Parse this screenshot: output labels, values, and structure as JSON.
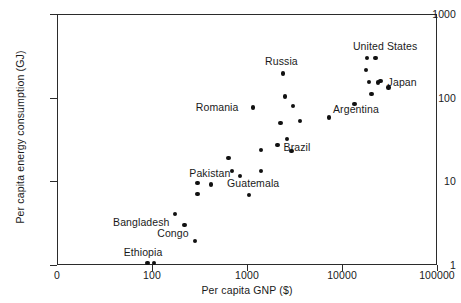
{
  "chart_data": {
    "type": "scatter",
    "title": "",
    "xlabel": "Per capita GNP ($)",
    "ylabel": "Per capita energy consumption (GJ)",
    "xscale": "log",
    "yscale": "log",
    "xlim": [
      100,
      100000
    ],
    "ylim": [
      1,
      1000
    ],
    "grid": false,
    "legend": "none",
    "origin_label": "0",
    "xticks": [
      {
        "label": "100",
        "value": 100
      },
      {
        "label": "1000",
        "value": 1000
      },
      {
        "label": "10000",
        "value": 10000
      },
      {
        "label": "100000",
        "value": 100000
      }
    ],
    "yticks": [
      {
        "label": "1",
        "value": 1
      },
      {
        "label": "10",
        "value": 10
      },
      {
        "label": "100",
        "value": 100
      },
      {
        "label": "1000",
        "value": 1000
      }
    ],
    "points": [
      {
        "x": 90,
        "y": 1.05,
        "label": "Ethiopia",
        "lx": -24,
        "ly": -16
      },
      {
        "x": 105,
        "y": 1.05,
        "label": "",
        "lx": 0,
        "ly": 0
      },
      {
        "x": 175,
        "y": 4.1,
        "label": "Bangladesh",
        "lx": -62,
        "ly": 3
      },
      {
        "x": 220,
        "y": 3.0,
        "label": "",
        "lx": 0,
        "ly": 0
      },
      {
        "x": 285,
        "y": 1.95,
        "label": "Congo",
        "lx": -38,
        "ly": -13
      },
      {
        "x": 300,
        "y": 7.0,
        "label": "",
        "lx": 0,
        "ly": 0
      },
      {
        "x": 300,
        "y": 9.6,
        "label": "Pakistan",
        "lx": -8,
        "ly": -15
      },
      {
        "x": 420,
        "y": 9.2,
        "label": "",
        "lx": 0,
        "ly": 0
      },
      {
        "x": 640,
        "y": 19.0,
        "label": "",
        "lx": 0,
        "ly": 0
      },
      {
        "x": 700,
        "y": 13.2,
        "label": "",
        "lx": 0,
        "ly": 0
      },
      {
        "x": 840,
        "y": 11.6,
        "label": "",
        "lx": 0,
        "ly": 0
      },
      {
        "x": 1050,
        "y": 6.9,
        "label": "Guatemala",
        "lx": -22,
        "ly": -17
      },
      {
        "x": 1150,
        "y": 76.0,
        "label": "Romania",
        "lx": -57,
        "ly": -6
      },
      {
        "x": 1400,
        "y": 13.3,
        "label": "",
        "lx": 0,
        "ly": 0
      },
      {
        "x": 1400,
        "y": 23.5,
        "label": "",
        "lx": 0,
        "ly": 0
      },
      {
        "x": 2100,
        "y": 27.0,
        "label": "Brazil",
        "lx": 6,
        "ly": -3
      },
      {
        "x": 2250,
        "y": 50.0,
        "label": "",
        "lx": 0,
        "ly": 0
      },
      {
        "x": 2400,
        "y": 195.0,
        "label": "Russia",
        "lx": -18,
        "ly": -17
      },
      {
        "x": 2500,
        "y": 103.0,
        "label": "",
        "lx": 0,
        "ly": 0
      },
      {
        "x": 2650,
        "y": 32.0,
        "label": "",
        "lx": 0,
        "ly": 0
      },
      {
        "x": 2950,
        "y": 23.0,
        "label": "",
        "lx": 0,
        "ly": 0
      },
      {
        "x": 3050,
        "y": 79.0,
        "label": "",
        "lx": 0,
        "ly": 0
      },
      {
        "x": 3600,
        "y": 53.0,
        "label": "",
        "lx": 0,
        "ly": 0
      },
      {
        "x": 7300,
        "y": 58.0,
        "label": "Argentina",
        "lx": 4,
        "ly": -13
      },
      {
        "x": 13500,
        "y": 84.0,
        "label": "",
        "lx": 0,
        "ly": 0
      },
      {
        "x": 17800,
        "y": 215.0,
        "label": "",
        "lx": 0,
        "ly": 0
      },
      {
        "x": 18300,
        "y": 300.0,
        "label": "United States",
        "lx": -14,
        "ly": -17
      },
      {
        "x": 19200,
        "y": 155.0,
        "label": "",
        "lx": 0,
        "ly": 0
      },
      {
        "x": 20400,
        "y": 110.0,
        "label": "",
        "lx": 0,
        "ly": 0
      },
      {
        "x": 22500,
        "y": 300.0,
        "label": "",
        "lx": 0,
        "ly": 0
      },
      {
        "x": 24000,
        "y": 152.0,
        "label": "",
        "lx": 0,
        "ly": 0
      },
      {
        "x": 25500,
        "y": 158.0,
        "label": "Japan",
        "lx": 7,
        "ly": -4
      },
      {
        "x": 31000,
        "y": 132.0,
        "label": "",
        "lx": 0,
        "ly": 0
      }
    ]
  }
}
